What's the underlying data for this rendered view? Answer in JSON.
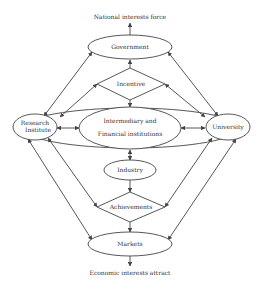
{
  "diagram": {
    "top_caption": "National interests force",
    "bottom_caption": "Economic interests attract",
    "nodes": {
      "government": "Government",
      "incentive": "Incentive",
      "research_line1": "Research",
      "research_line2": "Institute",
      "intermediary_line1": "Intermediary and",
      "intermediary_line2": "Financial institutions",
      "university": "University",
      "industry": "Industry",
      "achievements": "Achievements",
      "markets": "Markets"
    },
    "colors": {
      "stroke": "#444444",
      "text": "#333333",
      "background": "#ffffff"
    }
  }
}
